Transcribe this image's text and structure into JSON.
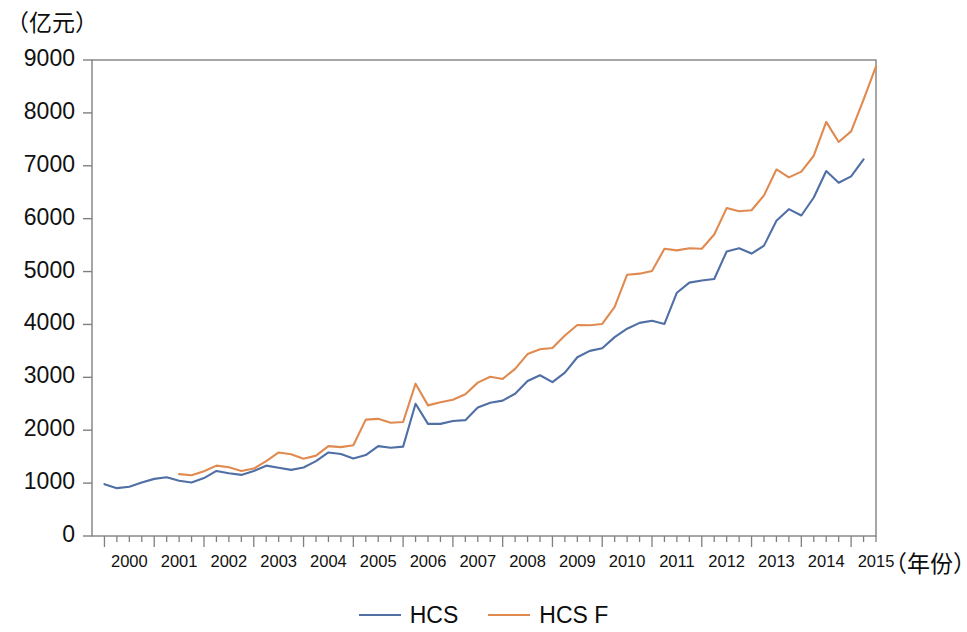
{
  "chart_data": {
    "type": "line",
    "title": "",
    "xlabel": "（年份）",
    "ylabel": "（亿元）",
    "ylim": [
      0,
      9000
    ],
    "ytick_step": 1000,
    "yticks": [
      "0",
      "1000",
      "2000",
      "3000",
      "4000",
      "5000",
      "6000",
      "7000",
      "8000",
      "9000"
    ],
    "xlim": [
      1999.75,
      2015.5
    ],
    "xticks": [
      "2000",
      "2001",
      "2002",
      "2003",
      "2004",
      "2005",
      "2006",
      "2007",
      "2008",
      "2009",
      "2010",
      "2011",
      "2012",
      "2013",
      "2014",
      "2015"
    ],
    "x_minor_ticks_per_year": 4,
    "grid": false,
    "legend_position": "bottom-center",
    "frequency": "quarterly",
    "series": [
      {
        "name": "HCS",
        "color": "#4f6fa5",
        "x_start": 2000.0,
        "x_step": 0.25,
        "values": [
          980,
          905,
          930,
          1010,
          1080,
          1110,
          1045,
          1010,
          1095,
          1230,
          1185,
          1155,
          1230,
          1330,
          1290,
          1250,
          1295,
          1415,
          1580,
          1550,
          1465,
          1530,
          1700,
          1670,
          1690,
          2500,
          2120,
          2120,
          2175,
          2190,
          2430,
          2520,
          2560,
          2690,
          2930,
          3040,
          2910,
          3090,
          3380,
          3500,
          3550,
          3760,
          3920,
          4030,
          4070,
          4010,
          4600,
          4790,
          4830,
          4860,
          5380,
          5440,
          5340,
          5490,
          5960,
          6180,
          6060,
          6400,
          6900,
          6680,
          6800,
          7120
        ]
      },
      {
        "name": "HCS F",
        "color": "#e08a50",
        "x_start": 2001.5,
        "x_step": 0.25,
        "values": [
          1170,
          1150,
          1225,
          1330,
          1300,
          1230,
          1275,
          1415,
          1580,
          1545,
          1460,
          1520,
          1700,
          1680,
          1715,
          2200,
          2215,
          2140,
          2155,
          2880,
          2470,
          2530,
          2575,
          2680,
          2900,
          3010,
          2970,
          3160,
          3440,
          3530,
          3555,
          3790,
          3990,
          3985,
          4010,
          4330,
          4940,
          4960,
          5010,
          5430,
          5400,
          5440,
          5430,
          5700,
          6200,
          6140,
          6160,
          6440,
          6930,
          6780,
          6890,
          7190,
          7830,
          7450,
          7650,
          8250,
          8880
        ]
      }
    ]
  },
  "legend": {
    "items": [
      {
        "label": "HCS",
        "color": "#4f6fa5"
      },
      {
        "label": "HCS  F",
        "color": "#e08a50"
      }
    ]
  },
  "axes": {
    "y_unit": "（亿元）",
    "x_unit": "（年份）"
  }
}
